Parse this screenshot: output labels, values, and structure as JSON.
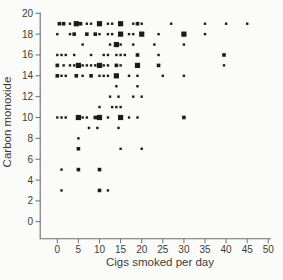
{
  "chart_data": {
    "type": "scatter",
    "title": "",
    "xlabel": "Cigs smoked per day",
    "ylabel": "Carbon monoxide",
    "xlim": [
      0,
      50
    ],
    "ylim": [
      0,
      20
    ],
    "xticks": [
      0,
      5,
      10,
      15,
      20,
      25,
      30,
      35,
      40,
      45,
      50
    ],
    "yticks": [
      0,
      2,
      4,
      6,
      8,
      10,
      12,
      14,
      16,
      18,
      20
    ],
    "grid": false,
    "legend": "none",
    "marker": "filled-square; size class encodes overlapping observations (s=1, m=2-3, l=4+)",
    "points": [
      [
        0.5,
        19,
        "m"
      ],
      [
        1.5,
        19,
        "m"
      ],
      [
        3,
        19,
        "s"
      ],
      [
        4.5,
        19,
        "l"
      ],
      [
        5.5,
        19,
        "m"
      ],
      [
        7,
        19,
        "s"
      ],
      [
        8,
        19,
        "s"
      ],
      [
        10,
        19,
        "l"
      ],
      [
        12,
        19,
        "s"
      ],
      [
        13,
        19,
        "s"
      ],
      [
        15,
        19,
        "l"
      ],
      [
        18,
        19,
        "s"
      ],
      [
        19,
        19,
        "m"
      ],
      [
        20,
        19,
        "s"
      ],
      [
        27,
        19,
        "s"
      ],
      [
        35,
        19,
        "s"
      ],
      [
        40,
        19,
        "s"
      ],
      [
        45,
        19,
        "s"
      ],
      [
        0,
        18,
        "s"
      ],
      [
        3,
        18,
        "s"
      ],
      [
        4,
        18,
        "m"
      ],
      [
        7,
        18,
        "m"
      ],
      [
        9,
        18,
        "m"
      ],
      [
        10,
        18,
        "s"
      ],
      [
        12,
        18,
        "s"
      ],
      [
        13,
        18,
        "s"
      ],
      [
        15,
        18,
        "l"
      ],
      [
        17,
        18,
        "s"
      ],
      [
        18,
        18,
        "s"
      ],
      [
        20,
        18,
        "l"
      ],
      [
        24,
        18,
        "s"
      ],
      [
        30,
        18,
        "l"
      ],
      [
        35,
        18,
        "s"
      ],
      [
        6,
        17,
        "s"
      ],
      [
        12.5,
        17,
        "s"
      ],
      [
        14,
        17,
        "l"
      ],
      [
        15,
        17,
        "s"
      ],
      [
        18,
        17,
        "s"
      ],
      [
        23,
        17,
        "s"
      ],
      [
        30,
        17,
        "s"
      ],
      [
        0,
        16,
        "s"
      ],
      [
        1,
        16,
        "s"
      ],
      [
        2,
        16,
        "s"
      ],
      [
        4,
        16,
        "s"
      ],
      [
        8,
        16,
        "s"
      ],
      [
        11,
        16,
        "s"
      ],
      [
        12,
        16,
        "s"
      ],
      [
        14,
        16,
        "s"
      ],
      [
        15,
        16,
        "s"
      ],
      [
        16,
        16,
        "s"
      ],
      [
        19,
        16,
        "m"
      ],
      [
        24,
        16,
        "s"
      ],
      [
        39.5,
        16,
        "m"
      ],
      [
        0,
        15,
        "m"
      ],
      [
        1.5,
        15,
        "s"
      ],
      [
        3,
        15,
        "s"
      ],
      [
        4,
        15,
        "s"
      ],
      [
        5,
        15,
        "l"
      ],
      [
        6,
        15,
        "s"
      ],
      [
        7,
        15,
        "s"
      ],
      [
        8,
        15,
        "s"
      ],
      [
        9,
        15,
        "s"
      ],
      [
        10,
        15,
        "l"
      ],
      [
        11,
        15,
        "s"
      ],
      [
        12,
        15,
        "s"
      ],
      [
        14,
        15,
        "m"
      ],
      [
        15,
        15,
        "s"
      ],
      [
        19,
        15,
        "l"
      ],
      [
        24,
        15,
        "m"
      ],
      [
        39.5,
        15,
        "s"
      ],
      [
        0,
        14,
        "m"
      ],
      [
        1,
        14,
        "s"
      ],
      [
        2,
        14,
        "s"
      ],
      [
        4.5,
        14,
        "m"
      ],
      [
        6,
        14,
        "s"
      ],
      [
        8,
        14,
        "m"
      ],
      [
        10,
        14,
        "s"
      ],
      [
        11,
        14,
        "s"
      ],
      [
        12,
        14,
        "s"
      ],
      [
        14,
        14,
        "l"
      ],
      [
        17,
        14,
        "s"
      ],
      [
        19,
        14,
        "s"
      ],
      [
        25,
        14,
        "s"
      ],
      [
        30,
        14,
        "s"
      ],
      [
        14,
        13,
        "s"
      ],
      [
        19,
        13,
        "s"
      ],
      [
        12.5,
        12,
        "s"
      ],
      [
        14.5,
        12,
        "s"
      ],
      [
        18,
        12,
        "s"
      ],
      [
        20,
        12,
        "s"
      ],
      [
        10,
        11,
        "s"
      ],
      [
        13,
        11,
        "s"
      ],
      [
        14,
        11,
        "s"
      ],
      [
        15,
        11,
        "s"
      ],
      [
        0,
        10,
        "s"
      ],
      [
        1,
        10,
        "s"
      ],
      [
        2,
        10,
        "s"
      ],
      [
        5,
        10,
        "l"
      ],
      [
        6,
        10,
        "s"
      ],
      [
        7,
        10,
        "s"
      ],
      [
        9,
        10,
        "m"
      ],
      [
        10,
        10,
        "l"
      ],
      [
        12,
        10,
        "s"
      ],
      [
        15,
        10,
        "l"
      ],
      [
        17,
        10,
        "s"
      ],
      [
        19,
        10,
        "s"
      ],
      [
        30,
        10,
        "m"
      ],
      [
        7.5,
        9,
        "s"
      ],
      [
        9.5,
        9,
        "s"
      ],
      [
        14.5,
        9,
        "s"
      ],
      [
        5,
        8,
        "s"
      ],
      [
        5,
        7,
        "m"
      ],
      [
        15,
        7,
        "s"
      ],
      [
        20,
        7,
        "s"
      ],
      [
        1,
        5,
        "s"
      ],
      [
        5,
        5,
        "m"
      ],
      [
        10,
        5,
        "m"
      ],
      [
        1,
        3,
        "s"
      ],
      [
        10,
        3,
        "m"
      ],
      [
        12,
        3,
        "s"
      ]
    ]
  }
}
